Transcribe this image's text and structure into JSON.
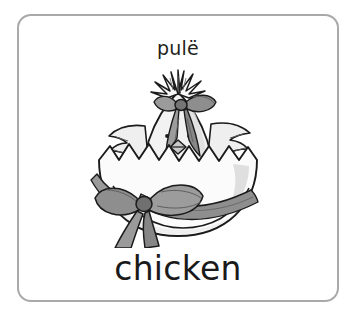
{
  "card": {
    "translation_word": "pulë",
    "target_word": "chicken",
    "illustration_name": "hatching-chick-in-decorated-eggshell",
    "border_color": "#a9a9a9",
    "background_color": "#ffffff",
    "text_color": "#231f20"
  },
  "illustration": {
    "subject": "chick hatching out of a cracked eggshell",
    "details": [
      "spiky feather tuft on head",
      "ribbon bow tied on head tuft",
      "two pointed wings spread out",
      "small diamond beak",
      "zigzag cracked eggshell rim",
      "large ribbon bow tied around the eggshell",
      "ribbon tails trailing to the right"
    ],
    "line_color": "#1b1b1b",
    "body_fill": "#f0f0f0",
    "shell_fill": "#fbfbfb",
    "ribbon_fill": "#8e8e8e",
    "ribbon_shade": "#6d6d6d",
    "ribbon_light": "#b4b4b4"
  }
}
